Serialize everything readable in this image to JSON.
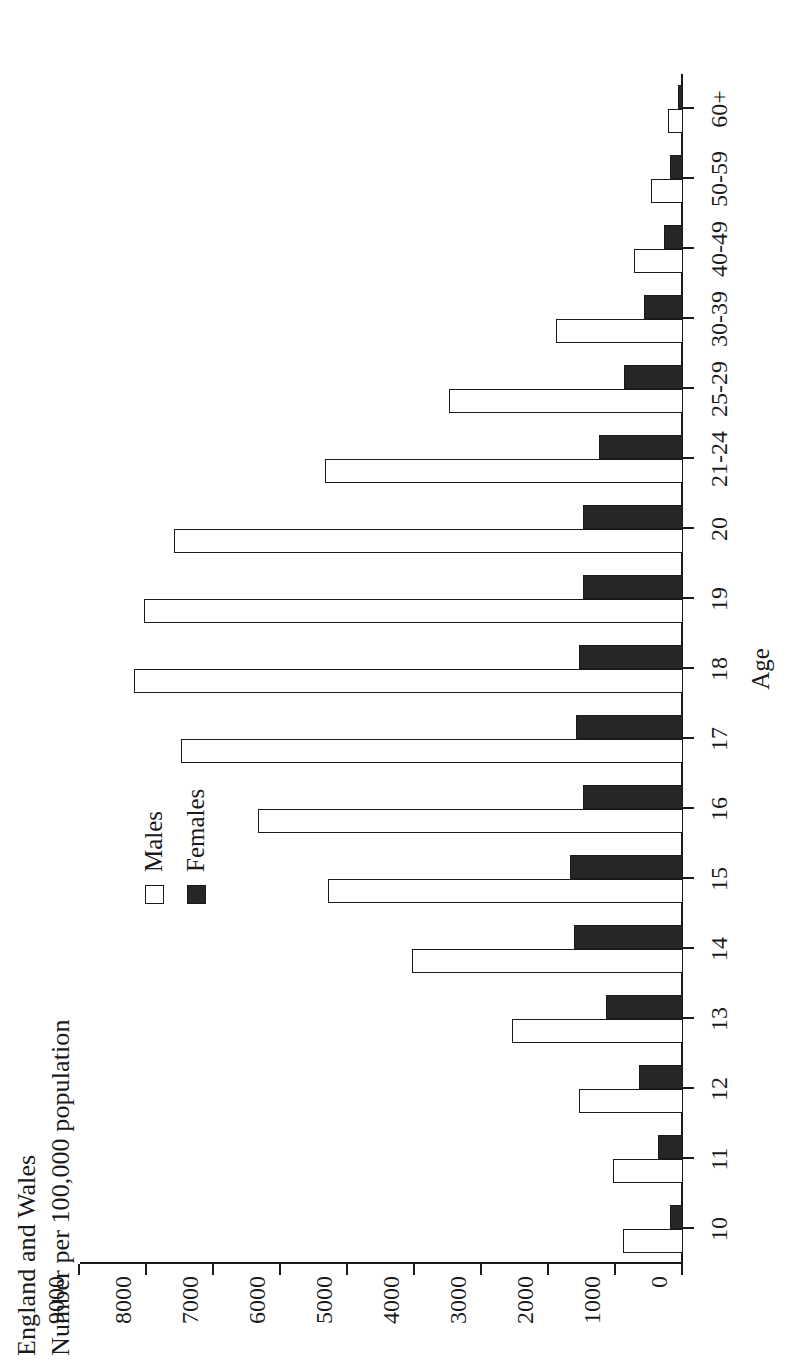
{
  "figure": {
    "title_lines": [
      "England and Wales",
      "Number per 100,000 population"
    ],
    "xaxis_title": "Age",
    "legend": [
      {
        "label": "Males",
        "swatch": "open-square",
        "color": "#ffffff"
      },
      {
        "label": "Females",
        "swatch": "filled-square",
        "color": "#262626"
      }
    ],
    "colors": {
      "males": "#ffffff",
      "females": "#262626",
      "axis": "#1a1a1a",
      "background": "#ffffff"
    }
  },
  "chart_data": {
    "type": "bar",
    "subtitle": "",
    "xlabel": "Age",
    "ylabel": "Number per 100,000 population",
    "orientation": "vertical",
    "grid": false,
    "legend_position": "top-right",
    "ylim": [
      0,
      9000
    ],
    "yticks": [
      0,
      1000,
      2000,
      3000,
      4000,
      5000,
      6000,
      7000,
      8000,
      9000
    ],
    "ytick_labels": [
      "0",
      "1000",
      "2000",
      "3000",
      "4000",
      "5000",
      "6000",
      "7000",
      "8000",
      "9000"
    ],
    "categories": [
      "10",
      "11",
      "12",
      "13",
      "14",
      "15",
      "16",
      "17",
      "18",
      "19",
      "20",
      "21-24",
      "25-29",
      "30-39",
      "40-49",
      "50-59",
      "60+"
    ],
    "series": [
      {
        "name": "Males",
        "color": "#ffffff",
        "values": [
          900,
          1050,
          1550,
          2550,
          4050,
          5300,
          6350,
          7500,
          8200,
          8050,
          7600,
          5350,
          3500,
          1900,
          730,
          480,
          230
        ]
      },
      {
        "name": "Females",
        "color": "#262626",
        "values": [
          200,
          370,
          650,
          1150,
          1620,
          1680,
          1500,
          1600,
          1550,
          1500,
          1500,
          1250,
          880,
          580,
          280,
          200,
          80
        ]
      }
    ]
  }
}
